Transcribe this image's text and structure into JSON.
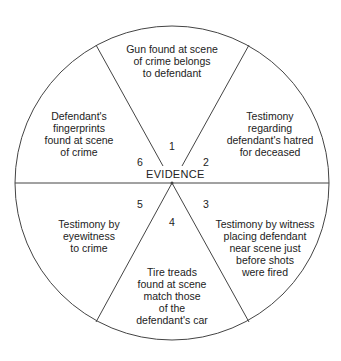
{
  "diagram": {
    "center_label": "EVIDENCE",
    "colors": {
      "line": "#444444",
      "text": "#222222",
      "background": "#ffffff"
    },
    "segments": [
      {
        "number": "1",
        "text": "Gun found at scene\nof crime belongs\nto defendant"
      },
      {
        "number": "2",
        "text": "Testimony\nregarding\ndefendant's hatred\nfor deceased"
      },
      {
        "number": "3",
        "text": "Testimony by witness\nplacing defendant\nnear scene just\nbefore shots\nwere fired"
      },
      {
        "number": "4",
        "text": "Tire treads\nfound at scene\nmatch those\nof the\ndefendant's car"
      },
      {
        "number": "5",
        "text": "Testimony by\neyewitness\nto crime"
      },
      {
        "number": "6",
        "text": "Defendant's\nfingerprints\nfound at scene\nof crime"
      }
    ]
  }
}
